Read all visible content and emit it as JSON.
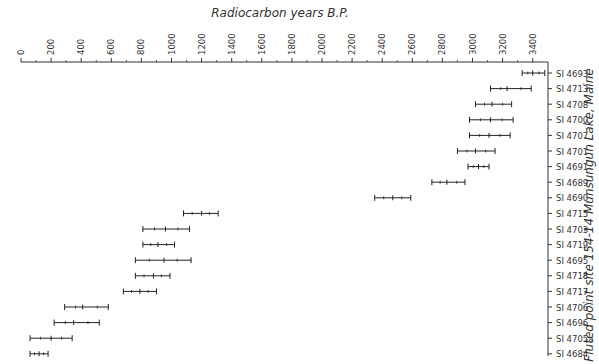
{
  "chart_data": {
    "type": "range",
    "title": "Radiocarbon years B.P.",
    "side_label": "Fluted point site 154-14 Munsungun Lake, Maine",
    "xlabel": "Radiocarbon years B.P.",
    "ylabel": "",
    "xlim": [
      0,
      3500
    ],
    "x_ticks": [
      0,
      200,
      400,
      600,
      800,
      1000,
      1200,
      1400,
      1600,
      1800,
      2000,
      2200,
      2400,
      2600,
      2800,
      3000,
      3200,
      3400
    ],
    "grid": false,
    "legend": null,
    "samples": [
      {
        "id": "SI 4693",
        "low": 3330,
        "mid": 3400,
        "high": 3480
      },
      {
        "id": "SI 4713",
        "low": 3120,
        "mid": 3230,
        "high": 3390
      },
      {
        "id": "SI 4708",
        "low": 3020,
        "mid": 3130,
        "high": 3260
      },
      {
        "id": "SI 4700",
        "low": 2980,
        "mid": 3120,
        "high": 3270
      },
      {
        "id": "SI 4707",
        "low": 2980,
        "mid": 3110,
        "high": 3250
      },
      {
        "id": "SI 4701",
        "low": 2900,
        "mid": 3020,
        "high": 3150
      },
      {
        "id": "SI 4691",
        "low": 2970,
        "mid": 3040,
        "high": 3110
      },
      {
        "id": "SI 4689",
        "low": 2730,
        "mid": 2830,
        "high": 2950
      },
      {
        "id": "SI 4690",
        "low": 2350,
        "mid": 2470,
        "high": 2590
      },
      {
        "id": "SI 4715",
        "low": 1080,
        "mid": 1200,
        "high": 1310
      },
      {
        "id": "SI 4703",
        "low": 810,
        "mid": 960,
        "high": 1120
      },
      {
        "id": "SI 4719",
        "low": 810,
        "mid": 910,
        "high": 1020
      },
      {
        "id": "SI 4695",
        "low": 760,
        "mid": 950,
        "high": 1130
      },
      {
        "id": "SI 4718",
        "low": 760,
        "mid": 880,
        "high": 990
      },
      {
        "id": "SI 4717",
        "low": 680,
        "mid": 790,
        "high": 900
      },
      {
        "id": "SI 4706",
        "low": 290,
        "mid": 410,
        "high": 580
      },
      {
        "id": "SI 4696",
        "low": 220,
        "mid": 350,
        "high": 520
      },
      {
        "id": "SI 4705a",
        "low": 60,
        "mid": 200,
        "high": 340
      },
      {
        "id": "SI 4684",
        "low": 60,
        "mid": 120,
        "high": 180
      },
      {
        "id": "SI 4705",
        "low": 20,
        "mid": 80,
        "high": 130
      }
    ]
  }
}
